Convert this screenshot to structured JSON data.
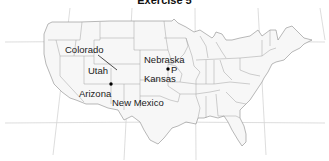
{
  "title": "Exercise 5",
  "map": {
    "region": "Contiguous United States",
    "colors": {
      "background": "#ffffff",
      "state_fill": "#f7f7f7",
      "state_border": "#8a8a8a",
      "graticule": "#d4d4d4",
      "marker": "#000000"
    },
    "labels": [
      {
        "id": "colorado",
        "text": "Colorado"
      },
      {
        "id": "utah",
        "text": "Utah"
      },
      {
        "id": "arizona",
        "text": "Arizona"
      },
      {
        "id": "new_mexico",
        "text": "New Mexico"
      },
      {
        "id": "nebraska",
        "text": "Nebraska"
      },
      {
        "id": "p",
        "text": "P"
      },
      {
        "id": "kansas",
        "text": "Kansas"
      }
    ],
    "markers": [
      {
        "name": "four-corners-point",
        "x": 111,
        "y": 84
      },
      {
        "name": "point-p",
        "x": 168,
        "y": 69
      }
    ]
  }
}
